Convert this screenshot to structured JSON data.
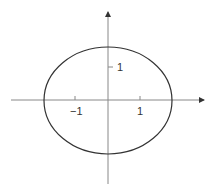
{
  "diagram": {
    "type": "ellipse-on-axes",
    "x_axis": {
      "ticks": [
        {
          "value": -1,
          "label": "−1"
        },
        {
          "value": 1,
          "label": "1"
        }
      ]
    },
    "y_axis": {
      "ticks": [
        {
          "value": 1,
          "label": "1"
        }
      ]
    },
    "ellipse": {
      "semi_axis_x": 2,
      "semi_axis_y": 1.7,
      "center": [
        0,
        0
      ]
    },
    "colors": {
      "axis": "#888888",
      "curve": "#333333",
      "text": "#333333"
    }
  }
}
